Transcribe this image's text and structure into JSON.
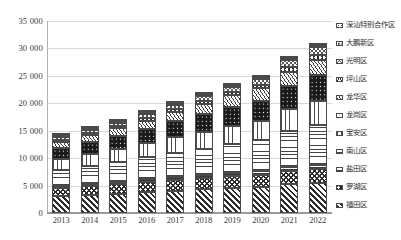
{
  "chart_data": {
    "type": "bar",
    "subtype": "stacked-vertical",
    "title": "",
    "xlabel": "",
    "ylabel": "",
    "ylim": [
      0,
      35000
    ],
    "ytick_step": 5000,
    "ytick_labels": [
      "0",
      "5 000",
      "10 000",
      "15 000",
      "20 000",
      "25 000",
      "30 000",
      "35 000"
    ],
    "ytick_values": [
      0,
      5000,
      10000,
      15000,
      20000,
      25000,
      30000,
      35000
    ],
    "grid": true,
    "grid_axis": "y",
    "legend_position": "right",
    "categories": [
      "2013",
      "2014",
      "2015",
      "2016",
      "2017",
      "2018",
      "2019",
      "2020",
      "2021",
      "2022"
    ],
    "stack_order": "bottom-to-top",
    "series": [
      {
        "name": "福田区",
        "pattern": "diagonal-stripes",
        "values": [
          3050,
          3280,
          3550,
          3820,
          4090,
          4320,
          4550,
          4750,
          5200,
          5500
        ]
      },
      {
        "name": "罗湖区",
        "pattern": "chevron",
        "values": [
          1480,
          1580,
          1680,
          1790,
          1910,
          2030,
          2150,
          2240,
          2430,
          2560
        ]
      },
      {
        "name": "盐田区",
        "pattern": "horizontal-dashes",
        "values": [
          420,
          450,
          480,
          520,
          560,
          600,
          640,
          670,
          730,
          770
        ]
      },
      {
        "name": "南山区",
        "pattern": "dash-grid",
        "values": [
          2980,
          3320,
          3650,
          4000,
          4400,
          4800,
          5200,
          5600,
          6600,
          7300
        ]
      },
      {
        "name": "宝安区",
        "pattern": "vertical-dashes",
        "values": [
          1980,
          2180,
          2380,
          2600,
          2850,
          3100,
          3350,
          3550,
          3950,
          4300
        ]
      },
      {
        "name": "龙岗区",
        "pattern": "dark-dots",
        "values": [
          1880,
          2100,
          2340,
          2600,
          2900,
          3200,
          3480,
          3700,
          4300,
          4700
        ]
      },
      {
        "name": "龙华区",
        "pattern": "fine-hatch",
        "values": [
          1120,
          1250,
          1390,
          1540,
          1720,
          1900,
          2070,
          2220,
          2560,
          2800
        ]
      },
      {
        "name": "坪山区",
        "pattern": "triangles",
        "values": [
          280,
          320,
          360,
          410,
          470,
          530,
          590,
          650,
          790,
          900
        ]
      },
      {
        "name": "光明区",
        "pattern": "crosshatch",
        "values": [
          500,
          570,
          640,
          720,
          820,
          920,
          1010,
          1090,
          1280,
          1420
        ]
      },
      {
        "name": "大鹏新区",
        "pattern": "sparse-dots",
        "values": [
          170,
          185,
          200,
          220,
          240,
          260,
          280,
          300,
          340,
          370
        ]
      },
      {
        "name": "深汕特别合作区",
        "pattern": "light-speckle",
        "values": [
          42,
          47,
          52,
          58,
          64,
          70,
          76,
          82,
          95,
          110
        ]
      }
    ],
    "totals": [
      13900,
      15280,
      16725,
      18280,
      20024,
      21730,
      23396,
      24912,
      28275,
      30730
    ],
    "legend_entries": [
      "深汕特别合作区",
      "大鹏新区",
      "光明区",
      "坪山区",
      "龙华区",
      "龙岗区",
      "宝安区",
      "南山区",
      "盐田区",
      "罗湖区",
      "福田区"
    ]
  },
  "colors": {
    "gridline": "#d9d9d9",
    "axis": "#9a9a9a",
    "tick_text": "#3a3a3a",
    "segment_outline": "#4a4a4a",
    "plot_background": "#ffffff"
  }
}
